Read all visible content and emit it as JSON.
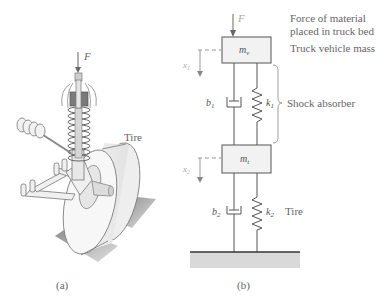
{
  "figure": {
    "panel_a": {
      "caption": "(a)",
      "force_label": "F",
      "tire_label": "Tire"
    },
    "panel_b": {
      "caption": "(b)",
      "force_label": "F",
      "annotations": {
        "force_line1": "Force of material",
        "force_line2": "placed in truck bed",
        "vehicle_mass": "Truck vehicle mass",
        "shock_absorber": "Shock absorber",
        "tire": "Tire"
      },
      "masses": {
        "upper": {
          "symbol": "m",
          "subscript": "v"
        },
        "lower": {
          "symbol": "m",
          "subscript": "t"
        }
      },
      "dampers": {
        "upper": {
          "symbol": "b",
          "subscript": "1"
        },
        "lower": {
          "symbol": "b",
          "subscript": "2"
        }
      },
      "springs": {
        "upper": {
          "symbol": "k",
          "subscript": "1"
        },
        "lower": {
          "symbol": "k",
          "subscript": "2"
        }
      },
      "displacements": {
        "upper": {
          "symbol": "x",
          "subscript": "1"
        },
        "lower": {
          "symbol": "x",
          "subscript": "2"
        }
      }
    }
  },
  "colors": {
    "line": "#555555",
    "mass_fill": "#f2f2f2",
    "ground_fill": "#d9d9d9",
    "dashed": "#999999",
    "shadow": "#9a9a9a"
  }
}
